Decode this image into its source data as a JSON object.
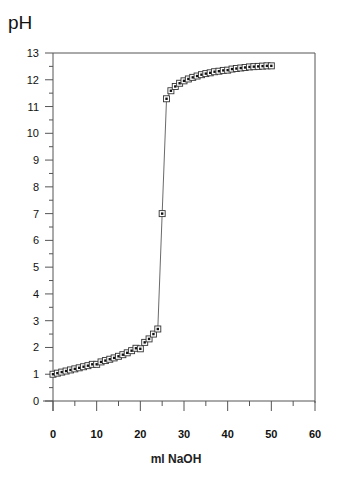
{
  "chart_data": {
    "type": "scatter",
    "title": "",
    "xlabel": "ml  NaOH",
    "ylabel": "pH",
    "xlim": [
      0,
      60
    ],
    "ylim": [
      0,
      13
    ],
    "x_ticks": [
      0,
      10,
      20,
      30,
      40,
      50,
      60
    ],
    "y_ticks": [
      0,
      1,
      2,
      3,
      4,
      5,
      6,
      7,
      8,
      9,
      10,
      11,
      12,
      13
    ],
    "grid": false,
    "legend": null,
    "marker": "square-with-dot",
    "connected_line": true,
    "series": [
      {
        "name": "Titration curve",
        "x": [
          0,
          1,
          2,
          3,
          4,
          5,
          6,
          7,
          8,
          9,
          10,
          11,
          12,
          13,
          14,
          15,
          16,
          17,
          18,
          19,
          20,
          21,
          22,
          23,
          24,
          25,
          26,
          27,
          28,
          29,
          30,
          31,
          32,
          33,
          34,
          35,
          36,
          37,
          38,
          39,
          40,
          41,
          42,
          43,
          44,
          45,
          46,
          47,
          48,
          49,
          50
        ],
        "y": [
          1.0,
          1.04,
          1.08,
          1.12,
          1.16,
          1.2,
          1.24,
          1.28,
          1.32,
          1.37,
          1.37,
          1.46,
          1.51,
          1.56,
          1.61,
          1.67,
          1.73,
          1.8,
          1.88,
          1.97,
          1.95,
          2.19,
          2.32,
          2.5,
          2.69,
          7.0,
          11.29,
          11.59,
          11.75,
          11.87,
          11.96,
          12.03,
          12.09,
          12.14,
          12.19,
          12.23,
          12.26,
          12.3,
          12.32,
          12.35,
          12.36,
          12.4,
          12.42,
          12.44,
          12.46,
          12.48,
          12.49,
          12.5,
          12.51,
          12.52,
          12.52
        ]
      }
    ]
  },
  "labels": {
    "y_axis_title": "pH",
    "x_axis_title": "ml  NaOH"
  }
}
